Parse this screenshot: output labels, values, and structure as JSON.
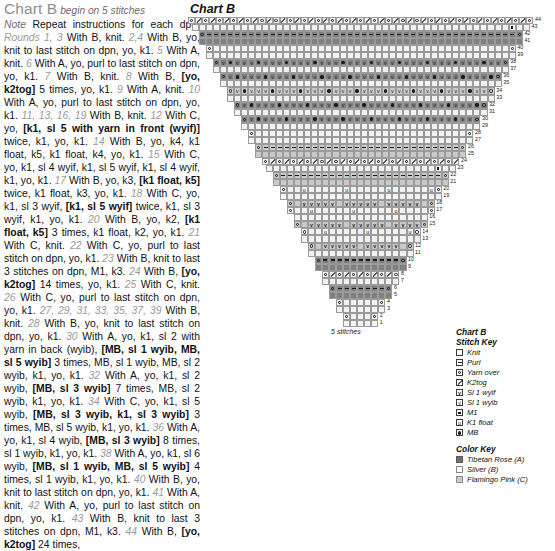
{
  "instructions": {
    "title": "Chart B",
    "title_note": "begin on 5 stitches",
    "note_label": "Note",
    "note_text": "Repeat instructions for each dpn.",
    "body_html": "body rendered from segments"
  },
  "chart": {
    "title": "Chart B",
    "bottom_label": "5 stitches",
    "total_rows": 44,
    "start_stitches": 5,
    "row_numbers_right": [
      44,
      43,
      42,
      41,
      40,
      39,
      38,
      37,
      36,
      35,
      34,
      33,
      32,
      31,
      30,
      29,
      28,
      27,
      26,
      25,
      24,
      23,
      22,
      21,
      20,
      19,
      18,
      17,
      16,
      15,
      14,
      13,
      12,
      11,
      10,
      9,
      8,
      7,
      6,
      5,
      4,
      3,
      2,
      1
    ]
  },
  "stitch_key": {
    "heading_line1": "Chart B",
    "heading_line2": "Stitch Key",
    "items": [
      {
        "symbol": "knit",
        "label": "Knit"
      },
      {
        "symbol": "purl",
        "label": "Purl"
      },
      {
        "symbol": "yarn-over",
        "label": "Yarn over"
      },
      {
        "symbol": "k2tog",
        "label": "K2tog"
      },
      {
        "symbol": "sl1-wyif",
        "label": "Sl 1 wyif"
      },
      {
        "symbol": "sl1-wyib",
        "label": "Sl 1 wyib"
      },
      {
        "symbol": "m1",
        "label": "M1"
      },
      {
        "symbol": "k1-float",
        "label": "K1 float"
      },
      {
        "symbol": "mb",
        "label": "MB"
      }
    ]
  },
  "color_key": {
    "heading": "Color Key",
    "items": [
      {
        "swatch": "sw-a",
        "label": "Tibetan Rose (A)",
        "hex": "#707070"
      },
      {
        "swatch": "sw-b",
        "label": "Silver (B)",
        "hex": "#ffffff"
      },
      {
        "swatch": "sw-c",
        "label": "Flamingo Pink (C)",
        "hex": "#c9c9c9"
      }
    ]
  },
  "rounds": [
    {
      "num": "Rounds 1, 3",
      "text": " With B, knit. "
    },
    {
      "num": "2,4",
      "text": " With B, yo, knit to last stitch on dpn, yo, k1. "
    },
    {
      "num": "5",
      "text": " With A, knit. "
    },
    {
      "num": "6",
      "text": " With A, yo, purl to last stitch on dpn, yo, k1. "
    },
    {
      "num": "7",
      "text": " With B, knit. "
    },
    {
      "num": "8",
      "text": " With B, [yo, k2tog] 5 times, yo, k1. "
    },
    {
      "num": "9",
      "text": " With A, knit. "
    },
    {
      "num": "10",
      "text": " With A, yo, purl to last stitch on dpn, yo, k1. "
    },
    {
      "num": "11, 13, 16, 19",
      "text": " With B, knit. "
    },
    {
      "num": "12",
      "text": " With C, yo, [k1, sl 5 with yarn in front (wyif)] twice, k1, yo, k1. "
    },
    {
      "num": "14",
      "text": " With B, yo, k4, k1 float, k5, k1 float, k4, yo, k1. "
    },
    {
      "num": "15",
      "text": " With C, yo, k1, sl 4 wyif, k1, sl 5 wyif, k1, sl 4 wyif, k1, yo, k1. "
    },
    {
      "num": "17",
      "text": " With B, yo, k3, [k1 float, k5] twice, k1 float, k3, yo, k1. "
    },
    {
      "num": "18",
      "text": " With C, yo, k1, sl 3 wyif, [k1, sl 5 wyif] twice, k1, sl 3 wyif, k1, yo, k1. "
    },
    {
      "num": "20",
      "text": " With B, yo, k2, [k1 float, k5] 3 times, k1 float, k2, yo, k1. "
    },
    {
      "num": "21",
      "text": " With C, knit. "
    },
    {
      "num": "22",
      "text": " With C, yo, purl to last stitch on dpn, yo, k1. "
    },
    {
      "num": "23",
      "text": " With B, knit to last 3 stitches on dpn, M1, k3. "
    },
    {
      "num": "24",
      "text": " With B, [yo, k2tog] 14 times, yo, k1. "
    },
    {
      "num": "25",
      "text": " With C, knit. "
    },
    {
      "num": "26",
      "text": " With C, yo, purl to last stitch on dpn, yo, k1. "
    },
    {
      "num": "27, 29, 31, 33, 35, 37, 39",
      "text": " With B, knit. "
    },
    {
      "num": "28",
      "text": " With B, yo, knit to last stitch on dpn, yo, k1. "
    },
    {
      "num": "30",
      "text": " With A, yo, k1, sl 2 with yarn in back (wyib), [MB, sl 1 wyib, MB, sl 5 wyib] 3 times, MB, sl 1 wyib, MB, sl 2 wyib, k1, yo, k1. "
    },
    {
      "num": "32",
      "text": " With A, yo, k1, sl 2 wyib, [MB, sl 3 wyib] 7 times, MB, sl 2 wyib, k1, yo, k1. "
    },
    {
      "num": "34",
      "text": " With C, yo, k1, sl 5 wyib, [MB, sl 3 wyib, k1, sl 3 wyib] 3 times, MB, sl 5 wyib, k1, yo, k1. "
    },
    {
      "num": "36",
      "text": " With A, yo, k1, sl 4 wyib, [MB, sl 3 wyib] 8 times, sl 1 wyib, k1, yo, k1. "
    },
    {
      "num": "38",
      "text": " With A, yo, k1, sl 6 wyib, [MB, sl 1 wyib, MB, sl 5 wyib] 4 times, sl 1 wyib, k1, yo, k1. "
    },
    {
      "num": "40",
      "text": " With B, yo, knit to last stitch on dpn, yo, k1. "
    },
    {
      "num": "41",
      "text": " With A, knit. "
    },
    {
      "num": "42",
      "text": " With A, yo, purl to last stitch on dpn, yo, k1. "
    },
    {
      "num": "43",
      "text": " With B, knit to last 3 stitches on dpn, M1, k3. "
    },
    {
      "num": "44",
      "text": " With B, [yo, k2tog] 24 times, "
    }
  ],
  "bold_phrases": [
    "[yo, k2tog]",
    "[k1, sl 5 with yarn in front (wyif)]",
    "[k1 float, k5]",
    "[k1, sl 5 wyif]",
    "[MB, sl 1 wyib, MB, sl 5 wyib]",
    "[MB, sl 3 wyib]",
    "[MB, sl 3 wyib, k1, sl 3 wyib]"
  ]
}
